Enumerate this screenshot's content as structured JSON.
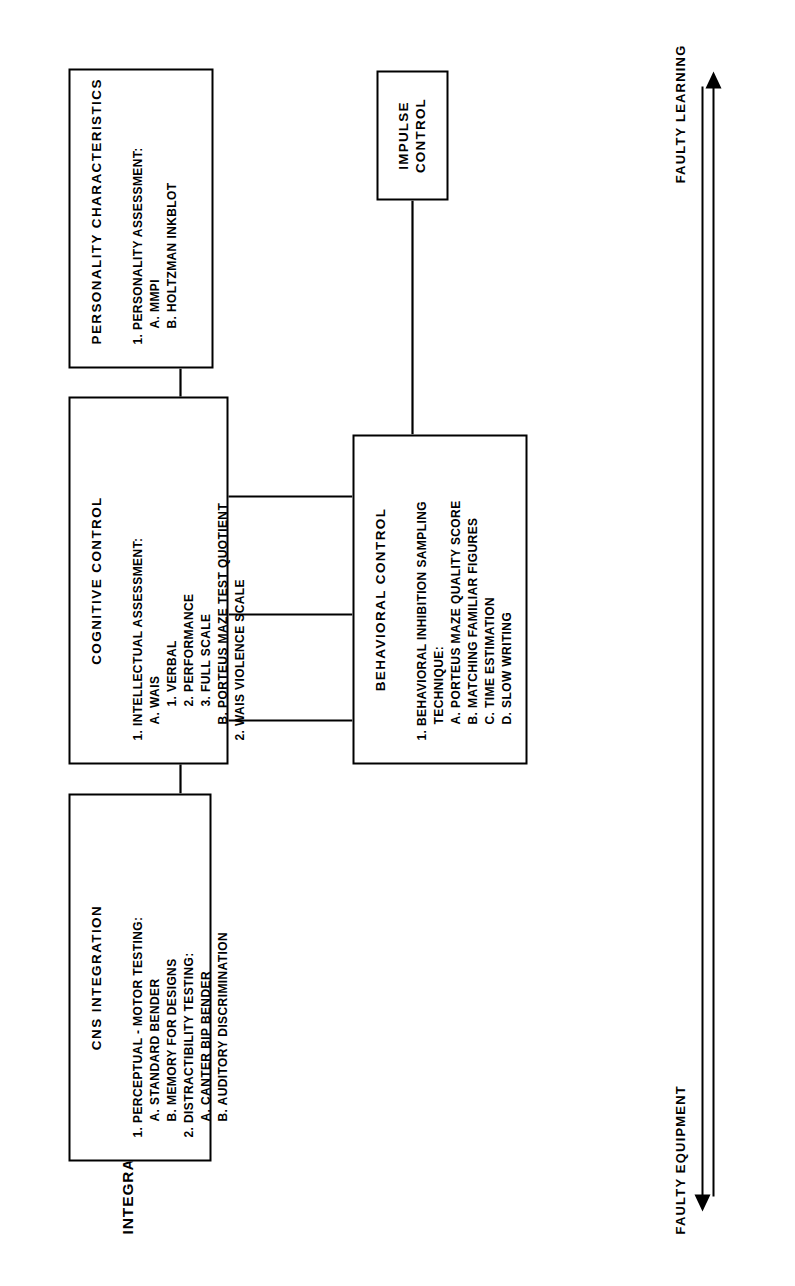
{
  "title": "INTEGRATIVE MODEL OF IMPULSE CONTROL",
  "axis": {
    "left_label": "FAULTY EQUIPMENT",
    "right_label": "FAULTY LEARNING",
    "left_arrow_icon": "arrow-left-icon",
    "right_arrow_icon": "arrow-right-icon"
  },
  "nodes": {
    "cns": {
      "title": "CNS  INTEGRATION",
      "items": [
        {
          "text": "1. PERCEPTUAL - MOTOR TESTING:",
          "indent": 0
        },
        {
          "text": "A. STANDARD BENDER",
          "indent": 1
        },
        {
          "text": "B. MEMORY FOR DESIGNS",
          "indent": 1
        },
        {
          "text": "2. DISTRACTIBILITY TESTING:",
          "indent": 0
        },
        {
          "text": "A. CANTER BIP BENDER",
          "indent": 1
        },
        {
          "text": "B. AUDITORY DISCRIMINATION",
          "indent": 1
        }
      ]
    },
    "cognitive": {
      "title": "COGNITIVE CONTROL",
      "items": [
        {
          "text": "1. INTELLECTUAL ASSESSMENT:",
          "indent": 0
        },
        {
          "text": "A. WAIS",
          "indent": 1
        },
        {
          "text": "1. VERBAL",
          "indent": 2
        },
        {
          "text": "2. PERFORMANCE",
          "indent": 2
        },
        {
          "text": "3. FULL SCALE",
          "indent": 2
        },
        {
          "text": "B. PORTEUS MAZE TEST QUOTIENT",
          "indent": 1
        },
        {
          "text": "2. WAIS VIOLENCE SCALE",
          "indent": 0
        }
      ]
    },
    "personality": {
      "title": "PERSONALITY CHARACTERISTICS",
      "items": [
        {
          "text": "1. PERSONALITY ASSESSMENT:",
          "indent": 0
        },
        {
          "text": "",
          "indent": 0
        },
        {
          "text": "A.  MMPI",
          "indent": 1
        },
        {
          "text": "B. HOLTZMAN INKBLOT",
          "indent": 1
        }
      ]
    },
    "behavioral": {
      "title": "BEHAVIORAL CONTROL",
      "items": [
        {
          "text": "1. BEHAVIORAL INHIBITION SAMPLING",
          "indent": 0
        },
        {
          "text": "TECHNIQUE:",
          "indent": 1
        },
        {
          "text": "A. PORTEUS MAZE QUALITY SCORE",
          "indent": 1
        },
        {
          "text": "B. MATCHING FAMILIAR FIGURES",
          "indent": 1
        },
        {
          "text": "C.  TIME ESTIMATION",
          "indent": 1
        },
        {
          "text": "D. SLOW WRITING",
          "indent": 1
        }
      ]
    },
    "impulse": {
      "title": "IMPULSE\nCONTROL"
    }
  },
  "colors": {
    "ink": "#000000",
    "paper": "#ffffff"
  }
}
